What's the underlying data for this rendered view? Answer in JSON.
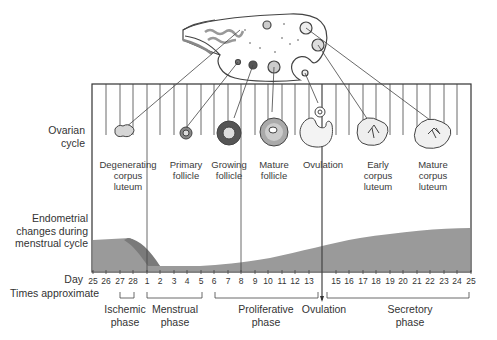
{
  "diagram": {
    "row_labels": {
      "ovarian": [
        "Ovarian",
        "cycle"
      ],
      "endometrial": [
        "Endometrial",
        "changes during",
        "menstrual cycle"
      ],
      "day": "Day",
      "times": "Times approximate"
    },
    "ovarian_stages": [
      {
        "id": "degenerating-corpus-luteum",
        "lines": [
          "Degenerating",
          "corpus",
          "luteum"
        ]
      },
      {
        "id": "primary-follicle",
        "lines": [
          "Primary",
          "follicle"
        ]
      },
      {
        "id": "growing-follicle",
        "lines": [
          "Growing",
          "follicle"
        ]
      },
      {
        "id": "mature-follicle",
        "lines": [
          "Mature",
          "follicle"
        ]
      },
      {
        "id": "ovulation",
        "lines": [
          "Ovulation"
        ]
      },
      {
        "id": "early-corpus-luteum",
        "lines": [
          "Early",
          "corpus",
          "luteum"
        ]
      },
      {
        "id": "mature-corpus-luteum",
        "lines": [
          "Mature",
          "corpus",
          "luteum"
        ]
      }
    ],
    "days": [
      "25",
      "26",
      "27",
      "28",
      "1",
      "2",
      "3",
      "4",
      "5",
      "6",
      "7",
      "8",
      "9",
      "10",
      "11",
      "12",
      "13",
      "",
      "15",
      "16",
      "17",
      "18",
      "19",
      "20",
      "21",
      "22",
      "23",
      "24",
      "25"
    ],
    "phases": [
      {
        "id": "ischemic",
        "lines": [
          "Ischemic",
          "phase"
        ]
      },
      {
        "id": "menstrual",
        "lines": [
          "Menstrual",
          "phase"
        ]
      },
      {
        "id": "proliferative",
        "lines": [
          "Proliferative",
          "phase"
        ]
      },
      {
        "id": "ovulation",
        "lines": [
          "Ovulation"
        ]
      },
      {
        "id": "secretory",
        "lines": [
          "Secretory",
          "phase"
        ]
      }
    ],
    "colors": {
      "line": "#333333",
      "endometrium": "#9a9a9a",
      "endometrium_dark": "#777777",
      "follicle_gray": "#bdbdbd"
    }
  }
}
